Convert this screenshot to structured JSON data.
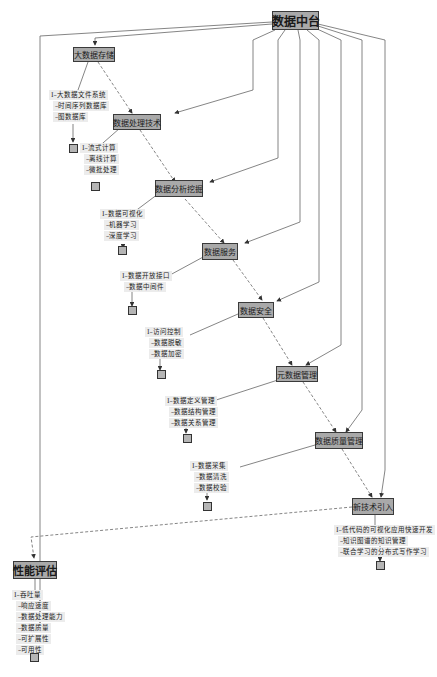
{
  "diagram": {
    "root": {
      "label": "数据中台"
    },
    "nodes": [
      {
        "id": "storage",
        "label": "大数据存储",
        "items": [
          "大数据文件系统",
          "时间序列数据库",
          "图数据库"
        ]
      },
      {
        "id": "processing",
        "label": "数据处理技术",
        "items": [
          "流式计算",
          "离线计算",
          "微批处理"
        ]
      },
      {
        "id": "analytics",
        "label": "数据分析挖掘",
        "items": [
          "数据可视化",
          "机器学习",
          "深度学习"
        ]
      },
      {
        "id": "service",
        "label": "数据服务",
        "items": [
          "数据开放接口",
          "数据中间件"
        ]
      },
      {
        "id": "security",
        "label": "数据安全",
        "items": [
          "访问控制",
          "数据脱敏",
          "数据加密"
        ]
      },
      {
        "id": "metadata",
        "label": "元数据管理",
        "items": [
          "数据定义管理",
          "数据结构管理",
          "数据关系管理"
        ]
      },
      {
        "id": "quality",
        "label": "数据质量管理",
        "items": [
          "数据采集",
          "数据清洗",
          "数据校验"
        ]
      },
      {
        "id": "newtech",
        "label": "新技术引入",
        "items": [
          "低代码的可视化应用快速开发",
          "知识图谱的知识管理",
          "联合学习的分布式写作学习"
        ]
      },
      {
        "id": "perf",
        "label": "性能评估",
        "items": [
          "吞吐量",
          "响应速度",
          "数据处理能力",
          "数据质量",
          "可扩展性",
          "可用性"
        ]
      }
    ],
    "list_prefix_first": "I–",
    "list_prefix_rest": "–"
  },
  "colors": {
    "node_fill": "#a9a9a9",
    "node_border": "#3a3a3a",
    "edge": "#555555",
    "list_bg": "#ececec"
  }
}
